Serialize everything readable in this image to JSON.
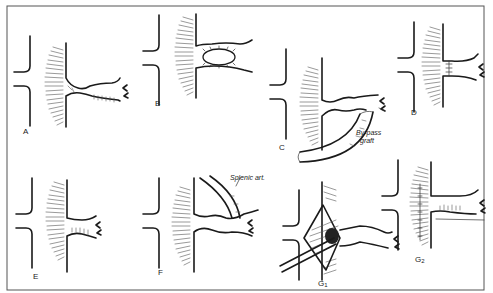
{
  "figure": {
    "border_color": "#555555",
    "ink_color": "#1a1a1a",
    "background": "#ffffff"
  },
  "panels": [
    {
      "id": "A",
      "label": "A",
      "description": "Stenosis of branch artery at origin from aorta"
    },
    {
      "id": "B",
      "label": "B",
      "description": "Patch angioplasty over stenotic segment"
    },
    {
      "id": "C",
      "label": "C",
      "description": "Aorto-arterial bypass graft",
      "annotation_line1": "By-pass",
      "annotation_line2": "graft"
    },
    {
      "id": "D",
      "label": "D",
      "description": "Resection with end-to-end anastomosis"
    },
    {
      "id": "E",
      "label": "E",
      "description": "Reimplantation into aorta"
    },
    {
      "id": "F",
      "label": "F",
      "description": "Splenic artery anastomosis",
      "annotation": "Splenic art."
    },
    {
      "id": "G1",
      "label": "G",
      "sub": "1",
      "description": "Transaortic endarterectomy"
    },
    {
      "id": "G2",
      "label": "G",
      "sub": "2",
      "description": "Completed endarterectomy closure"
    }
  ]
}
